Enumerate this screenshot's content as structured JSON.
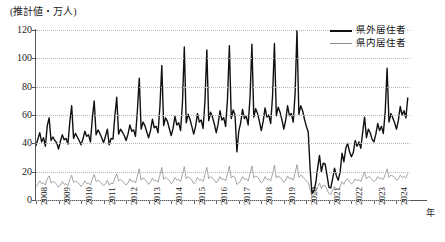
{
  "chart_data": {
    "type": "line",
    "title": "",
    "ylabel": "(推計値・万人)",
    "xlabel": "年",
    "ylim": [
      0,
      120
    ],
    "yticks": [
      0,
      20,
      40,
      60,
      80,
      100,
      120
    ],
    "xticks": [
      "2008",
      "2009",
      "2010",
      "2011",
      "2012",
      "2013",
      "2014",
      "2015",
      "2016",
      "2017",
      "2018",
      "2019",
      "2020",
      "2021",
      "2022",
      "2023",
      "2024"
    ],
    "xlim": [
      2008,
      2024.6
    ],
    "grid": true,
    "legend_position": "top-right",
    "x_start": 2008.0,
    "x_step_months": 1,
    "series": [
      {
        "name": "県外居住者",
        "color": "#111111",
        "line_width": 1.4,
        "values": [
          38.5,
          43.0,
          47.5,
          41.0,
          44.0,
          38.0,
          52.5,
          58.0,
          42.0,
          44.5,
          42.0,
          40.5,
          36.0,
          41.5,
          46.0,
          42.5,
          43.5,
          39.5,
          55.0,
          66.5,
          43.5,
          47.0,
          44.5,
          42.0,
          39.0,
          43.0,
          48.5,
          45.0,
          46.0,
          41.0,
          57.5,
          70.0,
          46.0,
          49.5,
          47.0,
          44.0,
          40.5,
          45.0,
          50.0,
          39.0,
          43.5,
          43.0,
          59.0,
          72.5,
          46.5,
          50.0,
          48.0,
          45.5,
          42.0,
          46.5,
          53.0,
          48.5,
          49.5,
          45.0,
          63.0,
          86.0,
          50.0,
          55.0,
          52.5,
          48.0,
          44.0,
          49.0,
          57.0,
          51.0,
          52.0,
          47.5,
          66.0,
          95.0,
          52.5,
          58.0,
          55.5,
          50.5,
          45.5,
          50.5,
          59.0,
          53.0,
          54.5,
          49.0,
          68.5,
          108.0,
          54.5,
          60.5,
          57.0,
          52.0,
          46.5,
          52.0,
          61.0,
          55.0,
          56.5,
          50.5,
          70.0,
          106.0,
          56.0,
          62.0,
          58.5,
          53.5,
          47.5,
          53.5,
          63.0,
          56.5,
          58.0,
          52.0,
          71.5,
          109.0,
          57.5,
          63.5,
          60.0,
          34.0,
          48.5,
          54.5,
          64.0,
          57.5,
          59.0,
          53.0,
          72.5,
          110.0,
          58.5,
          64.5,
          61.0,
          55.5,
          49.0,
          55.5,
          65.0,
          58.5,
          60.0,
          54.0,
          73.5,
          110.5,
          59.5,
          65.5,
          62.0,
          56.5,
          50.0,
          56.5,
          66.5,
          59.5,
          61.0,
          55.0,
          75.0,
          120.0,
          60.5,
          66.5,
          63.0,
          57.0,
          52.0,
          48.0,
          22.0,
          4.5,
          6.5,
          12.0,
          22.5,
          31.5,
          20.0,
          26.0,
          25.5,
          17.5,
          9.0,
          8.5,
          15.0,
          22.5,
          17.0,
          14.0,
          20.0,
          33.0,
          27.0,
          36.5,
          40.0,
          34.0,
          30.5,
          33.5,
          42.0,
          38.0,
          41.0,
          36.5,
          48.0,
          58.5,
          44.0,
          50.0,
          47.5,
          43.0,
          41.0,
          46.5,
          54.0,
          49.0,
          52.0,
          47.0,
          62.5,
          93.0,
          55.0,
          61.0,
          58.0,
          54.5,
          50.0,
          56.0,
          66.0,
          60.0,
          63.0,
          58.0,
          72.0
        ]
      },
      {
        "name": "県内居住者",
        "color": "#8e8e8e",
        "line_width": 0.8,
        "values": [
          9.5,
          11.0,
          13.5,
          11.5,
          12.0,
          10.5,
          15.0,
          17.0,
          12.0,
          13.0,
          12.5,
          11.0,
          9.0,
          10.5,
          13.0,
          11.0,
          11.5,
          10.0,
          14.5,
          17.5,
          12.5,
          13.5,
          12.5,
          11.5,
          9.5,
          11.0,
          13.5,
          11.5,
          12.0,
          10.5,
          15.0,
          18.0,
          13.0,
          14.0,
          13.0,
          11.5,
          10.0,
          11.5,
          14.0,
          10.5,
          12.0,
          11.5,
          15.5,
          18.5,
          13.5,
          14.5,
          13.5,
          12.0,
          10.5,
          12.0,
          15.0,
          13.0,
          13.5,
          12.0,
          17.0,
          22.0,
          14.0,
          15.5,
          14.5,
          13.0,
          11.0,
          12.5,
          15.5,
          13.5,
          14.0,
          12.5,
          17.5,
          23.0,
          14.5,
          16.0,
          15.0,
          13.5,
          11.5,
          13.0,
          16.0,
          14.0,
          14.5,
          13.0,
          18.0,
          23.5,
          15.0,
          16.5,
          15.5,
          14.0,
          11.5,
          13.0,
          16.0,
          14.0,
          14.5,
          13.0,
          18.0,
          23.0,
          15.0,
          16.5,
          15.5,
          14.0,
          12.0,
          13.5,
          16.5,
          14.5,
          15.0,
          13.5,
          18.5,
          24.0,
          15.5,
          17.0,
          16.0,
          11.0,
          12.0,
          13.5,
          16.5,
          14.5,
          15.0,
          13.5,
          18.5,
          24.0,
          15.5,
          17.0,
          16.0,
          14.5,
          12.0,
          13.5,
          16.5,
          14.5,
          15.0,
          13.5,
          18.5,
          24.5,
          15.5,
          17.0,
          16.0,
          14.5,
          12.5,
          14.0,
          17.0,
          15.0,
          15.5,
          14.0,
          19.0,
          25.0,
          16.0,
          17.5,
          16.5,
          15.0,
          13.5,
          12.5,
          7.5,
          2.5,
          3.5,
          5.5,
          9.0,
          12.0,
          8.0,
          10.5,
          10.0,
          7.5,
          4.5,
          4.0,
          7.0,
          9.5,
          8.0,
          7.0,
          9.5,
          13.0,
          11.0,
          14.0,
          15.0,
          13.0,
          11.5,
          12.5,
          15.0,
          13.5,
          14.5,
          13.0,
          16.5,
          19.5,
          15.0,
          16.5,
          16.0,
          14.5,
          13.0,
          14.0,
          16.5,
          15.0,
          15.5,
          14.5,
          18.0,
          22.0,
          16.0,
          17.5,
          17.0,
          16.0,
          14.0,
          15.0,
          17.5,
          16.0,
          16.5,
          15.5,
          18.5
        ]
      }
    ]
  },
  "legend": {
    "items": [
      {
        "label": "県外居住者",
        "style": "thick-black"
      },
      {
        "label": "県内居住者",
        "style": "thin-gray"
      }
    ]
  }
}
